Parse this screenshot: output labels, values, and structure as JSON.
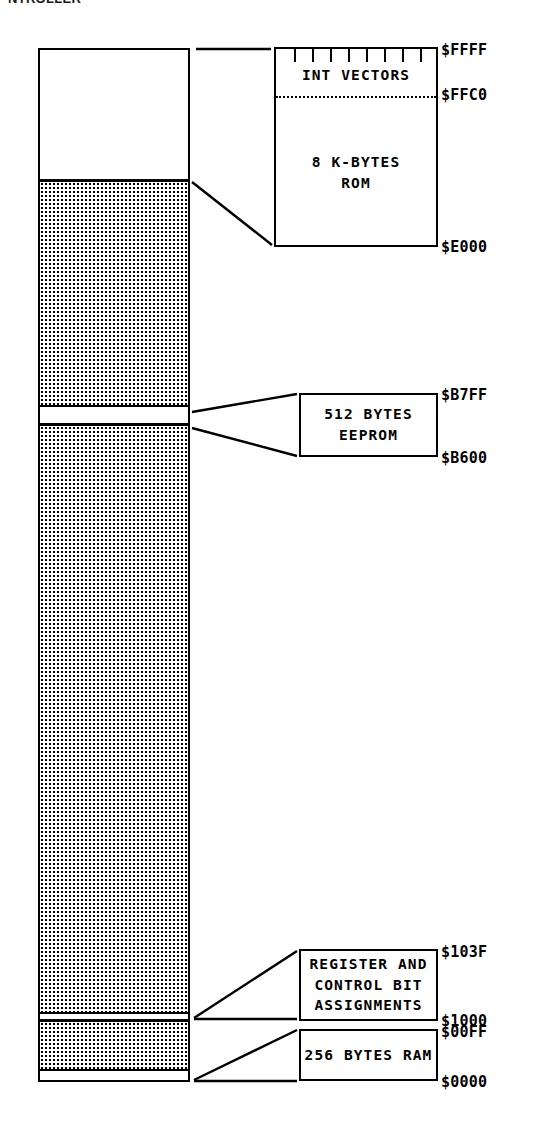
{
  "header": {
    "clipped_text": "NTROLLER"
  },
  "diagram": {
    "ink_color": "#000000",
    "background_color": "#ffffff"
  },
  "memory_column": {
    "segments": [
      {
        "name": "rom-region",
        "fill": "blank",
        "label": "8 K-BYTES ROM"
      },
      {
        "name": "unused-upper",
        "fill": "stipple",
        "label": ""
      },
      {
        "name": "eeprom-region",
        "fill": "blank",
        "label": "512 BYTES EEPROM"
      },
      {
        "name": "unused-middle",
        "fill": "stipple",
        "label": ""
      },
      {
        "name": "registers-region",
        "fill": "blank",
        "label": "REGISTER AND CONTROL BIT ASSIGNMENTS"
      },
      {
        "name": "unused-lower",
        "fill": "stipple",
        "label": ""
      },
      {
        "name": "ram-region",
        "fill": "blank",
        "label": "256 BYTES RAM"
      }
    ]
  },
  "callouts": {
    "rom": {
      "vectors_label": "INT VECTORS",
      "size_line1": "8 K-BYTES",
      "size_line2": "ROM",
      "tick_count": 8,
      "addr_top": "$FFFF",
      "addr_mid": "$FFC0",
      "addr_bottom": "$E000"
    },
    "eeprom": {
      "line1": "512 BYTES",
      "line2": "EEPROM",
      "addr_top": "$B7FF",
      "addr_bottom": "$B600"
    },
    "registers": {
      "line1": "REGISTER AND",
      "line2": "CONTROL BIT",
      "line3": "ASSIGNMENTS",
      "addr_top": "$103F",
      "addr_bottom": "$1000"
    },
    "ram": {
      "line1": "256 BYTES RAM",
      "addr_top": "$00FF",
      "addr_bottom": "$0000"
    }
  }
}
